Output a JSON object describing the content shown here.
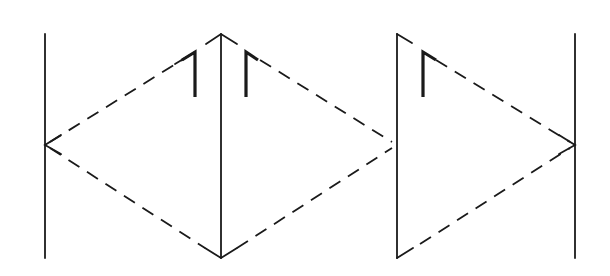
{
  "diagram": {
    "colors": {
      "line": "#1a1a1a",
      "background": "#ffffff"
    },
    "vertical_lines": [
      {
        "id": "left-line",
        "x": 45,
        "y1": 34,
        "y2": 258
      },
      {
        "id": "second-line",
        "x": 221,
        "y1": 34,
        "y2": 258
      },
      {
        "id": "third-line",
        "x": 397,
        "y1": 34,
        "y2": 258
      },
      {
        "id": "right-line",
        "x": 575,
        "y1": 34,
        "y2": 258
      }
    ],
    "dashed_paths": [
      {
        "id": "left-diamond-upper",
        "points": [
          [
            45,
            145
          ],
          [
            195,
            52
          ]
        ]
      },
      {
        "id": "left-diamond-lower",
        "points": [
          [
            45,
            145
          ],
          [
            221,
            258
          ]
        ]
      },
      {
        "id": "middle-diamond-upper",
        "points": [
          [
            246,
            52
          ],
          [
            397,
            145
          ]
        ]
      },
      {
        "id": "middle-diamond-lower",
        "points": [
          [
            221,
            258
          ],
          [
            397,
            145
          ]
        ]
      },
      {
        "id": "right-diamond-upper",
        "points": [
          [
            423,
            52
          ],
          [
            575,
            145
          ]
        ]
      },
      {
        "id": "right-diamond-lower",
        "points": [
          [
            397,
            258
          ],
          [
            575,
            145
          ]
        ]
      }
    ],
    "marks": [
      {
        "id": "mark-1",
        "shape": "reversed-L",
        "x": 195,
        "y1": 52,
        "y2": 97
      },
      {
        "id": "mark-2",
        "shape": "L",
        "x": 246,
        "y1": 52,
        "y2": 97
      },
      {
        "id": "mark-3",
        "shape": "L",
        "x": 423,
        "y1": 52,
        "y2": 97
      }
    ]
  }
}
